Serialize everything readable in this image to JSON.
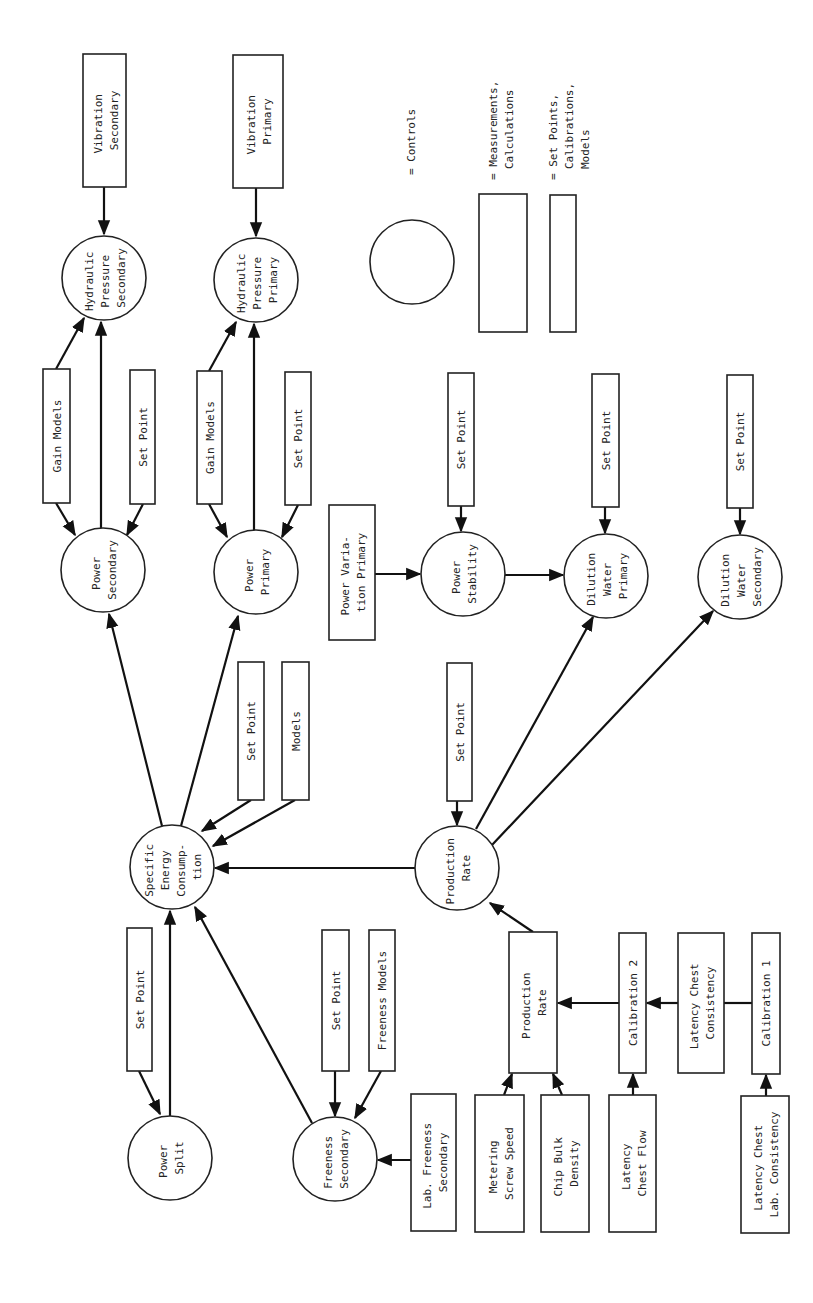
{
  "diagram": {
    "legend": {
      "controls": "= Controls",
      "measurements": [
        "= Measurements,",
        "Calculations"
      ],
      "setpoints": [
        "= Set Points,",
        "Calibrations,",
        "Models"
      ]
    },
    "nodes": {
      "vib_sec": [
        "Vibration",
        "Secondary"
      ],
      "vib_pri": [
        "Vibration",
        "Primary"
      ],
      "hyd_sec": [
        "Hydraulic",
        "Pressure",
        "Secondary"
      ],
      "hyd_pri": [
        "Hydraulic",
        "Pressure",
        "Primary"
      ],
      "gain_sec": [
        "Gain Models"
      ],
      "sp_sec": [
        "Set Point"
      ],
      "gain_pri": [
        "Gain Models"
      ],
      "sp_pri": [
        "Set Point"
      ],
      "pow_sec": [
        "Power",
        "Secondary"
      ],
      "pow_pri": [
        "Power",
        "Primary"
      ],
      "pow_var": [
        "Power Varia-",
        "tion Primary"
      ],
      "pow_stab": [
        "Power",
        "Stability"
      ],
      "sp_stab": [
        "Set Point"
      ],
      "dil_pri": [
        "Dilution",
        "Water",
        "Primary"
      ],
      "sp_dil_pri": [
        "Set Point"
      ],
      "dil_sec": [
        "Dilution",
        "Water",
        "Secondary"
      ],
      "sp_dil_sec": [
        "Set Point"
      ],
      "sec": [
        "Specific",
        "Energy",
        "Consump-",
        "tion"
      ],
      "sp_sec_energy": [
        "Set Point"
      ],
      "models_sec_energy": [
        "Models"
      ],
      "prod_rate_ctrl": [
        "Production",
        "Rate"
      ],
      "sp_prod": [
        "Set Point"
      ],
      "pow_split": [
        "Power",
        "Split"
      ],
      "sp_split": [
        "Set Point"
      ],
      "free_sec": [
        "Freeness",
        "Secondary"
      ],
      "sp_free": [
        "Set Point"
      ],
      "free_models": [
        "Freeness Models"
      ],
      "lab_free": [
        "Lab. Freeness",
        "Secondary"
      ],
      "prod_rate_meas": [
        "Production",
        "Rate"
      ],
      "cal2": [
        "Calibration 2"
      ],
      "lc_cons": [
        "Latency Chest",
        "Consistency"
      ],
      "cal1": [
        "Calibration 1"
      ],
      "meter": [
        "Metering",
        "Screw Speed"
      ],
      "chip": [
        "Chip Bulk",
        "Density"
      ],
      "lc_flow": [
        "Latency",
        "Chest Flow"
      ],
      "lc_lab": [
        "Latency Chest",
        "Lab. Consistency"
      ]
    }
  }
}
